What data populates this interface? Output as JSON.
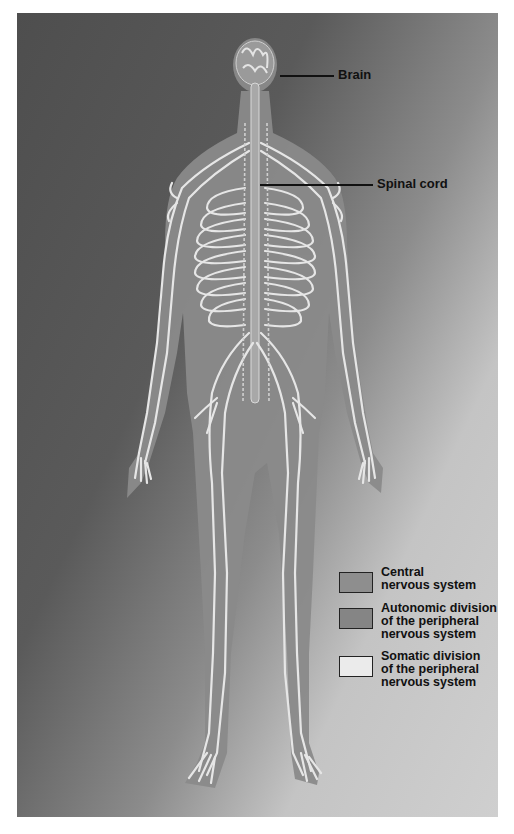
{
  "figure": {
    "background_gradient": [
      "#4e4e4e",
      "#cfcfcf"
    ],
    "body_color": "#8a8a8a",
    "nerve_color": "#e8e8e8"
  },
  "labels": {
    "brain": "Brain",
    "spinal_cord": "Spinal cord"
  },
  "legend": {
    "items": [
      {
        "line1": "Central",
        "line2": "nervous system",
        "line3": "",
        "color": "#8e8e8e"
      },
      {
        "line1": "Autonomic division",
        "line2": "of the peripheral",
        "line3": "nervous system",
        "color": "#858585"
      },
      {
        "line1": "Somatic division",
        "line2": "of the peripheral",
        "line3": "nervous system",
        "color": "#ebebeb"
      }
    ]
  }
}
